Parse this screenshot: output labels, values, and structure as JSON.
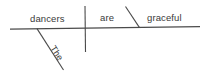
{
  "diagram": {
    "type": "reed-kellogg-sentence-diagram",
    "sentence": "The dancers are graceful.",
    "background_color": "#ffffff",
    "line_color": "#4a4a4a",
    "text_color": "#3a3a3a",
    "labels": {
      "subject": "dancers",
      "verb": "are",
      "complement": "graceful",
      "determiner": "The"
    },
    "parts": [
      {
        "role": "subject",
        "word": "dancers"
      },
      {
        "role": "linking-verb",
        "word": "are"
      },
      {
        "role": "predicate-adjective",
        "word": "graceful"
      },
      {
        "role": "article-modifier",
        "word": "The"
      }
    ]
  }
}
